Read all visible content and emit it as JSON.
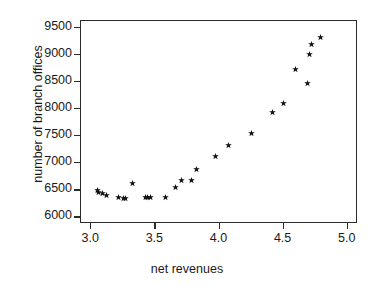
{
  "chart_data": {
    "type": "scatter",
    "title": "",
    "xlabel": "net revenues",
    "ylabel": "number of branch offices",
    "xlim": [
      2.92,
      5.08
    ],
    "ylim": [
      5880,
      9620
    ],
    "xticks": [
      3.0,
      3.5,
      4.0,
      4.5,
      5.0
    ],
    "xtick_labels": [
      "3.0",
      "3.5",
      "4.0",
      "4.5",
      "5.0"
    ],
    "yticks": [
      6000,
      6500,
      7000,
      7500,
      8000,
      8500,
      9000,
      9500
    ],
    "ytick_labels": [
      "6000",
      "6500",
      "7000",
      "7500",
      "8000",
      "8500",
      "9000",
      "9500"
    ],
    "grid": false,
    "legend": false,
    "marker": "star",
    "marker_color": "#111111",
    "frame_color": "#2b2b2b",
    "background": "#ffffff",
    "points": [
      {
        "x": 3.05,
        "y": 6490
      },
      {
        "x": 3.06,
        "y": 6455
      },
      {
        "x": 3.09,
        "y": 6440
      },
      {
        "x": 3.12,
        "y": 6400
      },
      {
        "x": 3.21,
        "y": 6360
      },
      {
        "x": 3.25,
        "y": 6355
      },
      {
        "x": 3.27,
        "y": 6345
      },
      {
        "x": 3.32,
        "y": 6635
      },
      {
        "x": 3.42,
        "y": 6365
      },
      {
        "x": 3.44,
        "y": 6365
      },
      {
        "x": 3.46,
        "y": 6365
      },
      {
        "x": 3.58,
        "y": 6375
      },
      {
        "x": 3.66,
        "y": 6545
      },
      {
        "x": 3.7,
        "y": 6680
      },
      {
        "x": 3.78,
        "y": 6675
      },
      {
        "x": 3.82,
        "y": 6885
      },
      {
        "x": 3.97,
        "y": 7120
      },
      {
        "x": 4.07,
        "y": 7330
      },
      {
        "x": 4.25,
        "y": 7545
      },
      {
        "x": 4.41,
        "y": 7930
      },
      {
        "x": 4.5,
        "y": 8100
      },
      {
        "x": 4.59,
        "y": 8720
      },
      {
        "x": 4.69,
        "y": 8470
      },
      {
        "x": 4.7,
        "y": 9005
      },
      {
        "x": 4.72,
        "y": 9185
      },
      {
        "x": 4.79,
        "y": 9325
      }
    ]
  }
}
